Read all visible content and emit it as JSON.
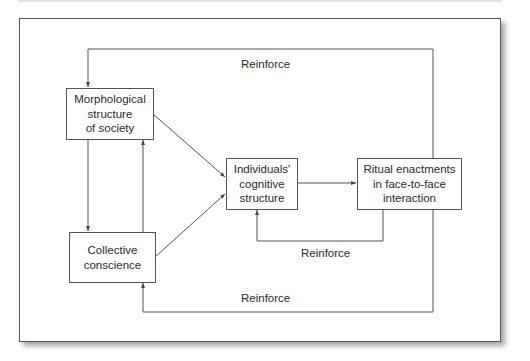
{
  "diagram": {
    "nodes": {
      "morphological": "Morphological\nstructure\nof society",
      "collective": "Collective\nconscience",
      "individuals": "Individuals'\ncognitive\nstructure",
      "ritual": "Ritual enactments\nin face-to-face\ninteraction"
    },
    "edge_labels": {
      "top_loop": "Reinforce",
      "inner_loop": "Reinforce",
      "bottom_loop": "Reinforce"
    },
    "edges": [
      {
        "from": "morphological",
        "to": "individuals"
      },
      {
        "from": "collective",
        "to": "individuals"
      },
      {
        "from": "morphological",
        "to": "collective"
      },
      {
        "from": "collective",
        "to": "morphological"
      },
      {
        "from": "individuals",
        "to": "ritual"
      },
      {
        "from": "ritual",
        "to": "individuals",
        "label": "Reinforce"
      },
      {
        "from": "ritual",
        "to": "morphological",
        "label": "Reinforce"
      },
      {
        "from": "ritual",
        "to": "collective",
        "label": "Reinforce"
      }
    ],
    "colors": {
      "line": "#555555",
      "text": "#2a2a2a",
      "background": "#ffffff"
    }
  }
}
